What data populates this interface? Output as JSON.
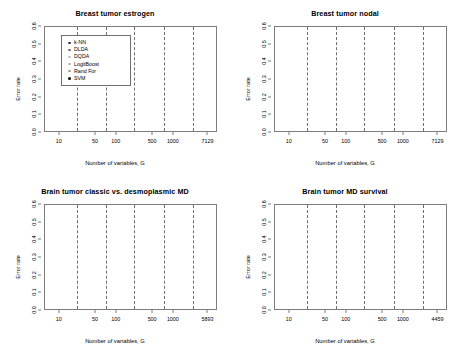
{
  "figure": {
    "xlabel": "Number of variables, G",
    "ylabel": "Error rate",
    "legend": {
      "items": [
        {
          "label": "k-NN",
          "marker": "knn",
          "color": "#3a3a3a"
        },
        {
          "label": "DLDA",
          "marker": "dlda",
          "color": "#6e6e6e"
        },
        {
          "label": "DQDA",
          "marker": "dqda",
          "color": "#c2c2c2"
        },
        {
          "label": "LogitBoost",
          "marker": "lb",
          "color": "#b4b4b4"
        },
        {
          "label": "Rand For",
          "marker": "rf",
          "color": "#9a9a9a"
        },
        {
          "label": "SVM",
          "marker": "svm",
          "color": "#000000"
        }
      ]
    }
  },
  "chart_data": [
    {
      "type": "scatter",
      "title": "Breast tumor estrogen",
      "xlabel": "Number of variables, G",
      "ylabel": "Error rate",
      "ylim": [
        0.0,
        0.6
      ],
      "yticks": [
        "0.0",
        "0.1",
        "0.2",
        "0.3",
        "0.4",
        "0.5",
        "0.6"
      ],
      "categories": [
        "10",
        "50",
        "100",
        "500",
        "1000",
        "7129"
      ],
      "grid": false,
      "legend_position": "top-left",
      "series": [
        {
          "name": "k-NN",
          "values": [
            0.105,
            0.08,
            0.075,
            0.11,
            0.085,
            0.112
          ]
        },
        {
          "name": "DLDA",
          "values": [
            0.08,
            0.072,
            0.07,
            0.1,
            0.082,
            0.11
          ]
        },
        {
          "name": "DQDA",
          "values": [
            0.062,
            0.06,
            0.08,
            0.085,
            0.075,
            0.048
          ]
        },
        {
          "name": "LogitBoost",
          "values": [
            0.07,
            0.09,
            0.088,
            0.125,
            0.1,
            0.112
          ]
        },
        {
          "name": "Rand For",
          "values": [
            0.085,
            0.062,
            0.072,
            0.095,
            0.068,
            0.11
          ]
        },
        {
          "name": "SVM",
          "values": [
            0.108,
            0.078,
            0.078,
            0.13,
            0.112,
            0.115
          ]
        }
      ]
    },
    {
      "type": "scatter",
      "title": "Breast tumor nodal",
      "xlabel": "Number of variables, G",
      "ylabel": "Error rate",
      "ylim": [
        0.0,
        0.6
      ],
      "yticks": [
        "0.0",
        "0.1",
        "0.2",
        "0.3",
        "0.4",
        "0.5",
        "0.6"
      ],
      "categories": [
        "10",
        "50",
        "100",
        "500",
        "1000",
        "7129"
      ],
      "grid": false,
      "legend_position": "none",
      "series": [
        {
          "name": "k-NN",
          "values": [
            0.185,
            0.245,
            0.375,
            0.385,
            0.42,
            0.485
          ]
        },
        {
          "name": "DLDA",
          "values": [
            0.18,
            0.24,
            0.345,
            0.33,
            0.33,
            0.34
          ]
        },
        {
          "name": "DQDA",
          "values": [
            0.215,
            0.22,
            0.31,
            0.255,
            0.255,
            0.25
          ]
        },
        {
          "name": "LogitBoost",
          "values": [
            0.172,
            0.385,
            0.4,
            0.35,
            0.37,
            0.4
          ]
        },
        {
          "name": "Rand For",
          "values": [
            0.165,
            0.3,
            0.335,
            0.275,
            0.3,
            0.38
          ]
        },
        {
          "name": "SVM",
          "values": [
            0.185,
            0.32,
            0.345,
            0.285,
            0.3,
            0.4
          ]
        }
      ]
    },
    {
      "type": "scatter",
      "title": "Brain tumor classic vs. desmoplasmic MD",
      "xlabel": "Number of variables, G",
      "ylabel": "Error rate",
      "ylim": [
        0.0,
        0.6
      ],
      "yticks": [
        "0.0",
        "0.1",
        "0.2",
        "0.3",
        "0.4",
        "0.5",
        "0.6"
      ],
      "categories": [
        "10",
        "50",
        "100",
        "500",
        "1000",
        "5893"
      ],
      "grid": false,
      "legend_position": "none",
      "series": [
        {
          "name": "k-NN",
          "values": [
            0.145,
            0.13,
            0.105,
            0.115,
            0.125,
            0.14
          ]
        },
        {
          "name": "DLDA",
          "values": [
            0.145,
            0.2,
            0.205,
            0.17,
            0.17,
            0.17
          ]
        },
        {
          "name": "DQDA",
          "values": [
            0.265,
            0.165,
            0.215,
            0.215,
            0.26,
            0.255
          ]
        },
        {
          "name": "LogitBoost",
          "values": [
            0.15,
            0.185,
            0.14,
            0.185,
            0.13,
            0.215
          ]
        },
        {
          "name": "Rand For",
          "values": [
            0.14,
            0.175,
            0.175,
            0.235,
            0.23,
            0.235
          ]
        },
        {
          "name": "SVM",
          "values": [
            0.145,
            0.13,
            0.205,
            0.17,
            0.125,
            0.17
          ]
        }
      ]
    },
    {
      "type": "scatter",
      "title": "Brain tumor MD survival",
      "xlabel": "Number of variables, G",
      "ylabel": "Error rate",
      "ylim": [
        0.0,
        0.6
      ],
      "yticks": [
        "0.0",
        "0.1",
        "0.2",
        "0.3",
        "0.4",
        "0.5",
        "0.6"
      ],
      "categories": [
        "10",
        "50",
        "100",
        "500",
        "1000",
        "4459"
      ],
      "grid": false,
      "legend_position": "none",
      "series": [
        {
          "name": "k-NN",
          "values": [
            0.33,
            0.42,
            0.36,
            0.39,
            0.405,
            0.425
          ]
        },
        {
          "name": "DLDA",
          "values": [
            0.3,
            0.375,
            0.345,
            0.345,
            0.35,
            0.375
          ]
        },
        {
          "name": "DQDA",
          "values": [
            0.285,
            0.35,
            0.3,
            0.31,
            0.26,
            0.28
          ]
        },
        {
          "name": "LogitBoost",
          "values": [
            0.31,
            0.4,
            0.415,
            0.38,
            0.36,
            0.355
          ]
        },
        {
          "name": "Rand For",
          "values": [
            0.3,
            0.345,
            0.335,
            0.32,
            0.305,
            0.32
          ]
        },
        {
          "name": "SVM",
          "values": [
            0.32,
            0.455,
            0.36,
            0.38,
            0.36,
            0.32
          ]
        }
      ]
    }
  ]
}
